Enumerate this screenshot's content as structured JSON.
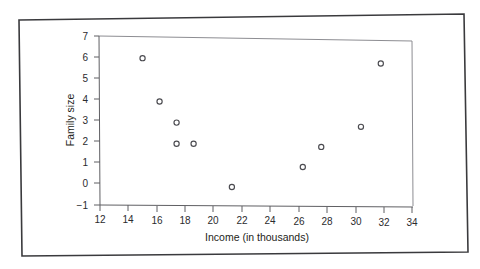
{
  "figure": {
    "kind": "scatter-plot",
    "background_color": "#ffffff",
    "ink_color": "#2b2b2e",
    "frame_color": "#8d8d92",
    "marker_style": "open-circle"
  },
  "chart_data": {
    "type": "scatter",
    "title": "",
    "xlabel": "Income (in thousands)",
    "ylabel": "Family size",
    "xlim": [
      12,
      34
    ],
    "ylim": [
      -1,
      7
    ],
    "xticks": [
      12,
      14,
      16,
      18,
      20,
      22,
      24,
      26,
      28,
      30,
      32,
      34
    ],
    "xtick_labels": [
      "12",
      "14",
      "16",
      "18",
      "20",
      "22",
      "24",
      "26",
      "28",
      "30",
      "32",
      "34"
    ],
    "yticks": [
      -1,
      0,
      1,
      2,
      3,
      4,
      5,
      6,
      7
    ],
    "ytick_labels": [
      "−1",
      "0",
      "1",
      "2",
      "3",
      "4",
      "5",
      "6",
      "7"
    ],
    "grid": false,
    "legend": null,
    "series": [
      {
        "name": "",
        "marker": "open-circle",
        "color": "#4b4b50",
        "points": [
          {
            "x": 15.0,
            "y": 5.95
          },
          {
            "x": 16.2,
            "y": 3.9
          },
          {
            "x": 17.4,
            "y": 2.9
          },
          {
            "x": 17.4,
            "y": 1.9
          },
          {
            "x": 18.6,
            "y": 1.9
          },
          {
            "x": 21.3,
            "y": -0.15
          },
          {
            "x": 26.3,
            "y": 0.8
          },
          {
            "x": 27.6,
            "y": 1.75
          },
          {
            "x": 30.4,
            "y": 2.7
          },
          {
            "x": 31.8,
            "y": 5.7
          }
        ]
      }
    ]
  }
}
